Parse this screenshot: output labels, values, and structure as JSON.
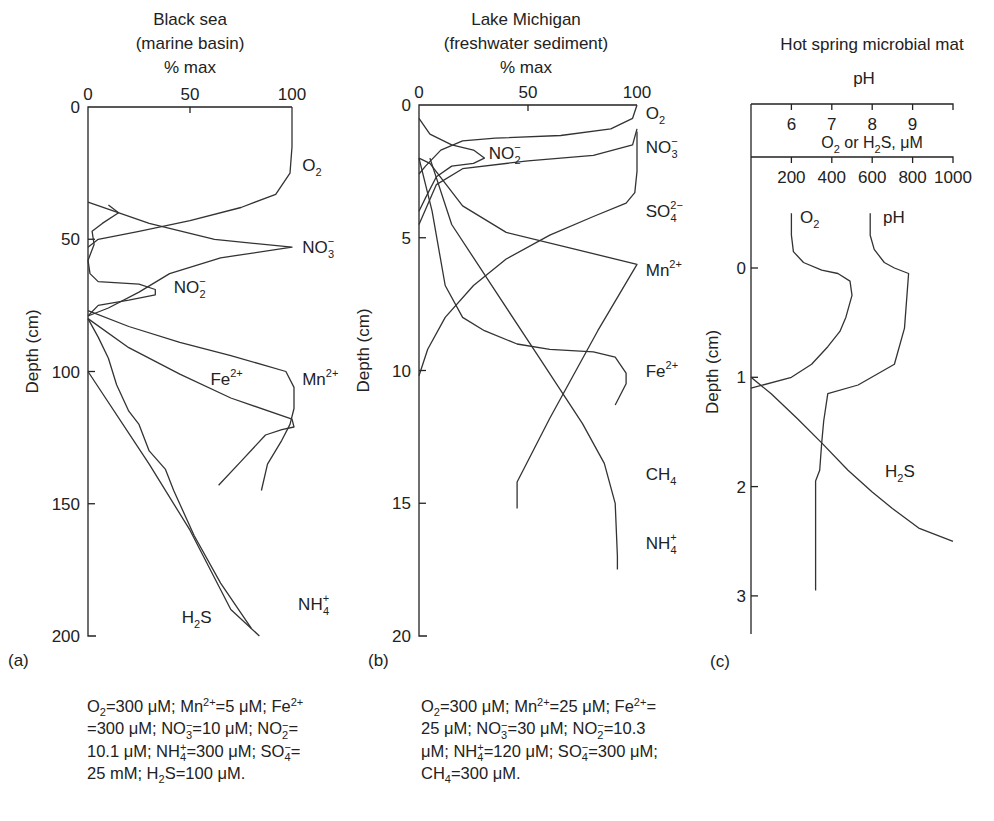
{
  "chart_data": [
    {
      "id": "a",
      "type": "line",
      "panel_label": "(a)",
      "title_lines": [
        "Black sea",
        "(marine basin)",
        "% max"
      ],
      "xlabel": "% max",
      "ylabel": "Depth (cm)",
      "xlim": [
        0,
        100
      ],
      "ylim": [
        0,
        200
      ],
      "y_inverted": true,
      "xticks": [
        "0",
        "50",
        "100"
      ],
      "yticks": [
        "0",
        "50",
        "100",
        "150",
        "200"
      ],
      "series": [
        {
          "name": "O2",
          "label": "O",
          "label_sub": "2",
          "label_sup": "",
          "points": [
            [
              100,
              0
            ],
            [
              100,
              15
            ],
            [
              99,
              25
            ],
            [
              92,
              33
            ],
            [
              75,
              38
            ],
            [
              50,
              43
            ],
            [
              25,
              47
            ],
            [
              5,
              50
            ],
            [
              0,
              53
            ]
          ]
        },
        {
          "name": "NO3-",
          "label": "NO",
          "label_sub": "3",
          "label_sup": "−",
          "points": [
            [
              0,
              36
            ],
            [
              30,
              44
            ],
            [
              62,
              50
            ],
            [
              100,
              53
            ],
            [
              65,
              57
            ],
            [
              40,
              63
            ],
            [
              25,
              70
            ],
            [
              10,
              76
            ],
            [
              0,
              79
            ]
          ]
        },
        {
          "name": "NO2-",
          "label": "NO",
          "label_sub": "2",
          "label_sup": "−",
          "points": [
            [
              10,
              37
            ],
            [
              15,
              40
            ],
            [
              7,
              44
            ],
            [
              2,
              47
            ],
            [
              3,
              52
            ],
            [
              0,
              58
            ],
            [
              1,
              63
            ],
            [
              5,
              66
            ],
            [
              25,
              67
            ],
            [
              33,
              69
            ],
            [
              33,
              71
            ],
            [
              20,
              73
            ],
            [
              5,
              75
            ],
            [
              0,
              79
            ]
          ]
        },
        {
          "name": "Mn2+",
          "label": "Mn",
          "label_sub": "",
          "label_sup": "2+",
          "points": [
            [
              0,
              77
            ],
            [
              20,
              83
            ],
            [
              45,
              89
            ],
            [
              70,
              94
            ],
            [
              97,
              100
            ],
            [
              101,
              106
            ],
            [
              101,
              114
            ],
            [
              99,
              120
            ],
            [
              95,
              126
            ],
            [
              88,
              135
            ],
            [
              85,
              145
            ]
          ]
        },
        {
          "name": "Fe2+",
          "label": "Fe",
          "label_sub": "",
          "label_sup": "2+",
          "points": [
            [
              0,
              80
            ],
            [
              20,
              91
            ],
            [
              45,
              101
            ],
            [
              70,
              110
            ],
            [
              100,
              118
            ],
            [
              101,
              121
            ],
            [
              95,
              122
            ],
            [
              87,
              124
            ],
            [
              75,
              134
            ],
            [
              64,
              143
            ]
          ]
        },
        {
          "name": "NH4+",
          "label": "NH",
          "label_sub": "4",
          "label_sup": "+",
          "points": [
            [
              0,
              80
            ],
            [
              5,
              87
            ],
            [
              10,
              95
            ],
            [
              14,
              105
            ],
            [
              20,
              115
            ],
            [
              25,
              120
            ],
            [
              30,
              130
            ],
            [
              38,
              137
            ],
            [
              42,
              145
            ],
            [
              52,
              162
            ],
            [
              65,
              180
            ],
            [
              80,
              197
            ]
          ]
        },
        {
          "name": "H2S",
          "label": "H",
          "label_sub": "2",
          "label_sup": "",
          "label_tail": "S",
          "points": [
            [
              0,
              100
            ],
            [
              30,
              135
            ],
            [
              50,
              160
            ],
            [
              70,
              190
            ],
            [
              84,
              200
            ]
          ]
        }
      ],
      "label_positions": {
        "O2": [
          105,
          22
        ],
        "NO3-": [
          105,
          53
        ],
        "NO2-": [
          42,
          68
        ],
        "Mn2+": [
          105,
          103
        ],
        "Fe2+": [
          60,
          103
        ],
        "NH4+": [
          103,
          188
        ],
        "H2S": [
          46,
          193
        ]
      },
      "caption_lines": [
        [
          [
            "O",
            "2",
            ""
          ],
          [
            "=300 μM; Mn",
            "",
            "2+"
          ],
          [
            "=5 μM; Fe",
            "",
            "2+"
          ]
        ],
        [
          [
            "=300 μM; NO",
            "3",
            "−"
          ],
          [
            "=10 μM; NO",
            "2",
            "−"
          ],
          [
            "=",
            "",
            " "
          ]
        ],
        [
          [
            "10.1 μM; NH",
            "4",
            "+"
          ],
          [
            "=300 μM; SO",
            "4",
            "−"
          ],
          [
            "=",
            "",
            " "
          ]
        ],
        [
          [
            "25 mM; H",
            "2",
            ""
          ],
          [
            "S=100 μM.",
            "",
            ""
          ]
        ]
      ]
    },
    {
      "id": "b",
      "type": "line",
      "panel_label": "(b)",
      "title_lines": [
        "Lake Michigan",
        "(freshwater sediment)",
        "% max"
      ],
      "xlabel": "% max",
      "ylabel": "Depth (cm)",
      "xlim": [
        0,
        100
      ],
      "ylim": [
        0,
        20
      ],
      "y_inverted": true,
      "xticks": [
        "0",
        "50",
        "100"
      ],
      "yticks": [
        "0",
        "5",
        "10",
        "15",
        "20"
      ],
      "series": [
        {
          "name": "O2",
          "label": "O",
          "label_sub": "2",
          "label_sup": "",
          "points": [
            [
              100,
              0
            ],
            [
              98,
              0.5
            ],
            [
              88,
              0.9
            ],
            [
              65,
              1.15
            ],
            [
              35,
              1.25
            ],
            [
              20,
              1.35
            ],
            [
              10,
              1.7
            ],
            [
              3,
              2.3
            ],
            [
              0,
              2.6
            ]
          ]
        },
        {
          "name": "NO3-",
          "label": "NO",
          "label_sub": "3",
          "label_sup": "−",
          "points": [
            [
              100,
              0.9
            ],
            [
              98,
              1.5
            ],
            [
              80,
              1.9
            ],
            [
              50,
              2.1
            ],
            [
              20,
              2.4
            ],
            [
              8,
              3.0
            ],
            [
              0,
              4.5
            ]
          ]
        },
        {
          "name": "NO2-",
          "label": "NO",
          "label_sub": "2",
          "label_sup": "−",
          "points": [
            [
              0,
              0.5
            ],
            [
              5,
              1.1
            ],
            [
              15,
              1.5
            ],
            [
              25,
              1.7
            ],
            [
              30,
              2.0
            ],
            [
              25,
              2.2
            ],
            [
              15,
              2.3
            ],
            [
              8,
              2.7
            ],
            [
              3,
              3.5
            ],
            [
              0,
              4.0
            ]
          ]
        },
        {
          "name": "SO42-",
          "label": "SO",
          "label_sub": "4",
          "label_sup": "2−",
          "points": [
            [
              100,
              1.0
            ],
            [
              100,
              2.5
            ],
            [
              99,
              3.3
            ],
            [
              95,
              3.7
            ],
            [
              80,
              4.2
            ],
            [
              60,
              4.9
            ],
            [
              40,
              5.8
            ],
            [
              25,
              6.8
            ],
            [
              12,
              8.0
            ],
            [
              4,
              9.2
            ],
            [
              0,
              10.2
            ]
          ]
        },
        {
          "name": "Mn2+",
          "label": "Mn",
          "label_sub": "",
          "label_sup": "2+",
          "points": [
            [
              0,
              2.0
            ],
            [
              5,
              2.2
            ],
            [
              20,
              3.8
            ],
            [
              40,
              4.8
            ],
            [
              70,
              5.4
            ],
            [
              100,
              6.0
            ],
            [
              82,
              8.5
            ],
            [
              60,
              11.8
            ],
            [
              45,
              14.2
            ],
            [
              45,
              15.2
            ]
          ]
        },
        {
          "name": "Fe2+",
          "label": "Fe",
          "label_sub": "",
          "label_sup": "2+",
          "points": [
            [
              0,
              2.0
            ],
            [
              6,
              4.0
            ],
            [
              12,
              6.8
            ],
            [
              20,
              8.0
            ],
            [
              30,
              8.5
            ],
            [
              45,
              9.0
            ],
            [
              60,
              9.2
            ],
            [
              80,
              9.3
            ],
            [
              90,
              9.5
            ],
            [
              95,
              10.1
            ],
            [
              95,
              10.5
            ],
            [
              90,
              11.3
            ]
          ]
        },
        {
          "name": "CH4",
          "label": "CH",
          "label_sub": "4",
          "label_sup": "",
          "points": [
            [
              5,
              2.0
            ],
            [
              15,
              4.5
            ],
            [
              35,
              7.0
            ],
            [
              55,
              9.5
            ],
            [
              75,
              12.0
            ],
            [
              85,
              13.5
            ],
            [
              90,
              15.0
            ],
            [
              91,
              17.0
            ],
            [
              91,
              17.5
            ]
          ]
        }
      ],
      "extra_labels": [
        {
          "text": "NH",
          "sub": "4",
          "sup": "+",
          "name": "NH4+"
        }
      ],
      "label_positions": {
        "O2": [
          104,
          0.3
        ],
        "NO3-": [
          104,
          1.6
        ],
        "NO2-": [
          32,
          1.8
        ],
        "SO42-": [
          104,
          4.0
        ],
        "Mn2+": [
          104,
          6.2
        ],
        "Fe2+": [
          104,
          10.0
        ],
        "CH4": [
          104,
          13.9
        ],
        "NH4+": [
          104,
          16.5
        ]
      },
      "caption_lines": [
        [
          [
            "O",
            "2",
            ""
          ],
          [
            "=300 μM; Mn",
            "",
            "2+"
          ],
          [
            "=25 μM; Fe",
            "",
            "2+"
          ],
          [
            "=",
            "",
            ""
          ]
        ],
        [
          [
            "25 μM; NO",
            "3",
            "−"
          ],
          [
            "=30 μM; NO",
            "2",
            "−"
          ],
          [
            "=10.3",
            "",
            ""
          ]
        ],
        [
          [
            "μM; NH",
            "4",
            "+"
          ],
          [
            "=120 μM; SO",
            "4",
            "−"
          ],
          [
            "=300 μM;",
            "",
            ""
          ]
        ],
        [
          [
            "CH",
            "4",
            ""
          ],
          [
            "=300 μM.",
            "",
            ""
          ]
        ]
      ]
    },
    {
      "id": "c",
      "type": "line",
      "panel_label": "(c)",
      "title_lines": [
        "Hot spring microbial mat"
      ],
      "top_axis_label": "pH",
      "mid_axis_label": [
        "O",
        "2",
        " or H",
        "2",
        "S, μM"
      ],
      "ylabel": "Depth (cm)",
      "ph_lim": [
        5,
        10
      ],
      "conc_lim": [
        0,
        1000
      ],
      "ylim": [
        -1.5,
        3.35
      ],
      "y_inverted": true,
      "ph_ticks": [
        "6",
        "7",
        "8",
        "9"
      ],
      "conc_ticks": [
        "200",
        "400",
        "600",
        "800",
        "1000"
      ],
      "yticks": [
        "0",
        "1",
        "2",
        "3"
      ],
      "series": [
        {
          "name": "O2",
          "axis": "conc",
          "label": "O",
          "label_sub": "2",
          "label_sup": "",
          "points": [
            [
              200,
              -0.5
            ],
            [
              200,
              -0.3
            ],
            [
              210,
              -0.15
            ],
            [
              260,
              -0.05
            ],
            [
              350,
              0.02
            ],
            [
              430,
              0.05
            ],
            [
              490,
              0.12
            ],
            [
              500,
              0.25
            ],
            [
              470,
              0.45
            ],
            [
              440,
              0.58
            ],
            [
              380,
              0.72
            ],
            [
              300,
              0.88
            ],
            [
              200,
              1.0
            ],
            [
              0,
              1.1
            ]
          ]
        },
        {
          "name": "pH",
          "axis": "ph",
          "label": "pH",
          "label_sub": "",
          "label_sup": "",
          "points": [
            [
              7.95,
              -0.5
            ],
            [
              7.95,
              -0.3
            ],
            [
              8.05,
              -0.17
            ],
            [
              8.3,
              -0.05
            ],
            [
              8.55,
              0.0
            ],
            [
              8.9,
              0.05
            ],
            [
              8.8,
              0.55
            ],
            [
              8.55,
              0.88
            ],
            [
              7.65,
              1.07
            ],
            [
              6.9,
              1.15
            ],
            [
              6.8,
              1.4
            ],
            [
              6.75,
              1.6
            ],
            [
              6.7,
              1.85
            ],
            [
              6.6,
              1.95
            ],
            [
              6.6,
              2.2
            ],
            [
              6.6,
              2.95
            ]
          ]
        },
        {
          "name": "H2S",
          "axis": "conc",
          "label": "H",
          "label_sub": "2",
          "label_sup": "",
          "label_tail": "S",
          "points": [
            [
              0,
              1.0
            ],
            [
              100,
              1.15
            ],
            [
              230,
              1.38
            ],
            [
              350,
              1.6
            ],
            [
              480,
              1.85
            ],
            [
              600,
              2.05
            ],
            [
              700,
              2.2
            ],
            [
              830,
              2.38
            ],
            [
              1000,
              2.5
            ]
          ]
        }
      ]
    }
  ],
  "labels": {
    "o2": "O2",
    "pH": "pH"
  }
}
